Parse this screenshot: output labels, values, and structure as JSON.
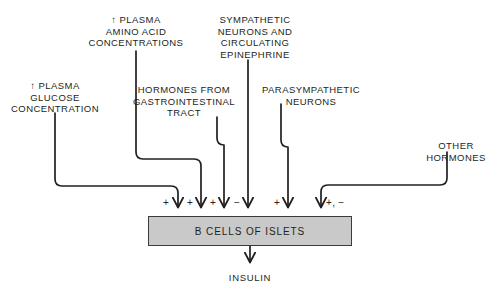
{
  "diagram": {
    "output_label": "INSULIN",
    "target_box": {
      "label": "B CELLS OF ISLETS",
      "fill_color": "#c9c9c9",
      "border_color": "#3b3b3b"
    },
    "ink_color": "#231f20",
    "inputs": [
      {
        "id": "plasma-glucose",
        "label": "↑ PLASMA\nGLUCOSE\nCONCENTRATION",
        "sign": "+"
      },
      {
        "id": "plasma-amino-acid",
        "label": "↑ PLASMA\nAMINO ACID\nCONCENTRATIONS",
        "sign": "+"
      },
      {
        "id": "gi-hormones",
        "label": "HORMONES FROM\nGASTROINTESTINAL\nTRACT",
        "sign": "+"
      },
      {
        "id": "sympathetic-neurons",
        "label": "SYMPATHETIC\nNEURONS AND\nCIRCULATING\nEPINEPHRINE",
        "sign": "−"
      },
      {
        "id": "parasympathetic-neurons",
        "label": "PARASYMPATHETIC\nNEURONS",
        "sign": "+"
      },
      {
        "id": "other-hormones",
        "label": "OTHER\nHORMONES",
        "sign": "+, −"
      }
    ]
  }
}
